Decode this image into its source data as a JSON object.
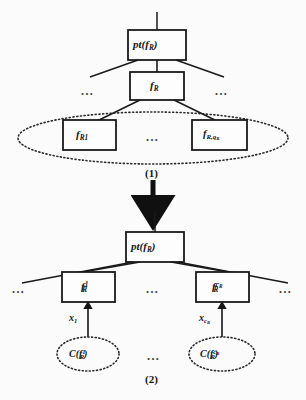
{
  "figure": {
    "background": "#fbfbfb",
    "ink": "#1a1a1a",
    "panels": [
      {
        "id": "panel-1",
        "step_label": "(1)"
      },
      {
        "id": "panel-2",
        "step_label": "(2)"
      }
    ]
  },
  "panel1": {
    "root_box": {
      "text": "pt(f",
      "sub": "R",
      "close": ")"
    },
    "mid_box": {
      "text": "f",
      "sub": "R"
    },
    "leaf_left": {
      "text": "f",
      "sub": "R1"
    },
    "leaf_right": {
      "text": "f",
      "sub": "R,q",
      "subsub": "R"
    },
    "ellipsis_left": "...",
    "ellipsis_right": "...",
    "ellipsis_leaves": "...",
    "group_shape": "dotted-ellipse",
    "step_label": "(1)"
  },
  "panel2": {
    "root_box": {
      "text": "pt(f",
      "sub": "R",
      "close": ")"
    },
    "child_left": {
      "text": "f",
      "sub": "R",
      "sup": "1"
    },
    "child_right": {
      "text": "f",
      "sub": "R",
      "sup": "c",
      "supsub": "R"
    },
    "edge_left": {
      "text": "x",
      "sub": "1"
    },
    "edge_right": {
      "text": "x",
      "sub": "c",
      "subsub": "R"
    },
    "ellipse_left": {
      "text": "C(f",
      "sub": "R",
      "sup": "1",
      "close": ")"
    },
    "ellipse_right": {
      "text": "C(f",
      "sub": "R",
      "sup": "c",
      "supsub": "R",
      "close": ")"
    },
    "ellipsis_far_left": "...",
    "ellipsis_center": "...",
    "ellipsis_far_right": "...",
    "ellipsis_bottom": "...",
    "step_label": "(2)"
  }
}
